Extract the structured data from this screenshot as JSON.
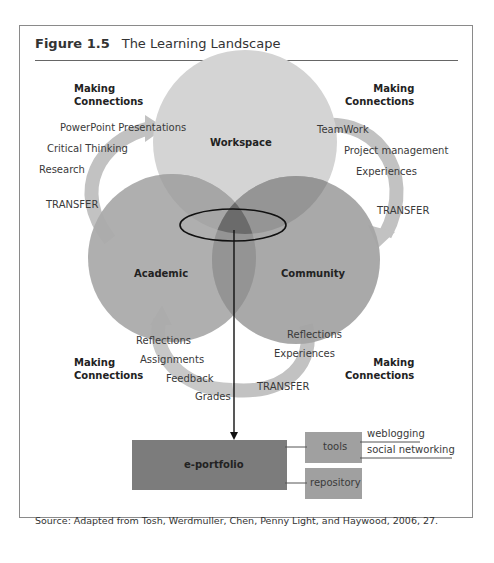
{
  "figure": {
    "number": "Figure 1.5",
    "title": "The Learning Landscape"
  },
  "circles": {
    "workspace": "Workspace",
    "academic": "Academic",
    "community": "Community"
  },
  "making_connections": {
    "line1": "Making",
    "line2": "Connections"
  },
  "left_top_items": [
    "PowerPoint Presentations",
    "Critical Thinking",
    "Research",
    "TRANSFER"
  ],
  "right_top_items": [
    "TeamWork",
    "Project management",
    "Experiences",
    "TRANSFER"
  ],
  "bottom_left_items": [
    "Reflections",
    "Assignments",
    "Feedback",
    "Grades"
  ],
  "bottom_right_items": [
    "Reflections",
    "Experiences",
    "TRANSFER"
  ],
  "eportfolio": {
    "main": "e-portfolio",
    "tools": "tools",
    "repository": "repository",
    "tool_items": [
      "weblogging",
      "social networking"
    ]
  },
  "source": "Source: Adapted from Tosh, Werdmuller, Chen, Penny Light, and Haywood, 2006, 27.",
  "colors": {
    "workspace": "#d2d2d2",
    "academic": "#a9a9a9",
    "community": "#a3a3a3",
    "arrow": "#bdbdbd",
    "box_main": "#7c7c7c",
    "box_side": "#a0a0a0"
  }
}
